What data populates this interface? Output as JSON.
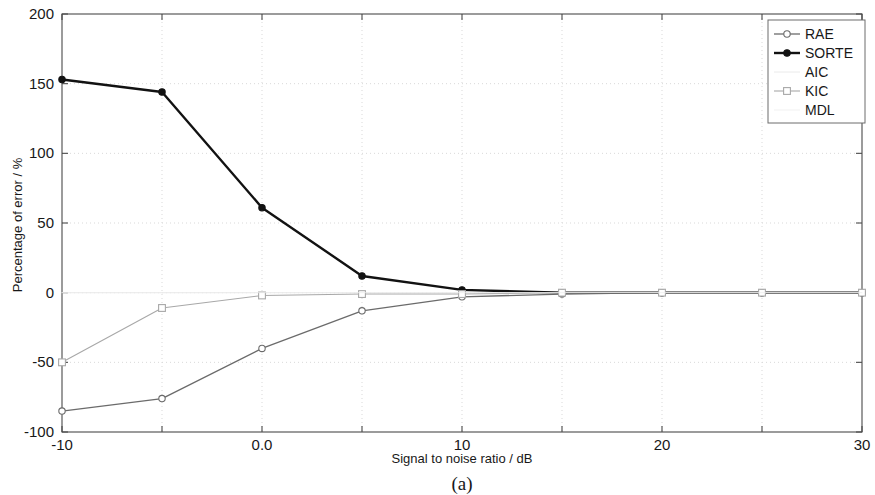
{
  "figure": {
    "caption": "(a)"
  },
  "chart_data": {
    "type": "line",
    "title": "",
    "xlabel": "Signal to noise ratio / dB",
    "ylabel": "Percentage of error / %",
    "xlim": [
      -10,
      30
    ],
    "ylim": [
      -100,
      200
    ],
    "xticks": [
      -10,
      -5,
      0,
      5,
      10,
      15,
      20,
      25,
      30
    ],
    "xticklabels": [
      "-10",
      "",
      "0.0",
      "",
      "10",
      "",
      "20",
      "",
      "30"
    ],
    "yticks": [
      -100,
      -50,
      0,
      50,
      100,
      150,
      200
    ],
    "yticklabels": [
      "-100",
      "-50",
      "0",
      "50",
      "100",
      "150",
      "200"
    ],
    "grid": true,
    "legend_position": "top-right",
    "x": [
      -10,
      -5,
      0,
      5,
      10,
      15,
      20,
      25,
      30
    ],
    "series": [
      {
        "name": "RAE",
        "color": "#6b6b6b",
        "marker": "circle",
        "marker_filled": false,
        "linewidth": 1.3,
        "values": [
          -85,
          -76,
          -40,
          -13,
          -3,
          -1,
          0,
          0,
          0
        ]
      },
      {
        "name": "SORTE",
        "color": "#121212",
        "marker": "circle",
        "marker_filled": true,
        "linewidth": 2.4,
        "values": [
          153,
          144,
          61,
          12,
          2,
          0,
          0,
          0,
          0
        ]
      },
      {
        "name": "AIC",
        "color": "#e4e4e4",
        "marker": "none",
        "marker_filled": false,
        "linewidth": 0.8,
        "values": [
          0,
          0,
          0,
          0,
          0,
          0,
          0,
          0,
          0
        ]
      },
      {
        "name": "KIC",
        "color": "#a8a8a8",
        "marker": "square",
        "marker_filled": false,
        "linewidth": 1.1,
        "values": [
          -50,
          -11,
          -2,
          -1,
          -1,
          0,
          0,
          0,
          0
        ]
      },
      {
        "name": "MDL",
        "color": "#ededed",
        "marker": "none",
        "marker_filled": false,
        "linewidth": 0.8,
        "values": [
          0,
          0,
          0,
          0,
          0,
          0,
          0,
          0,
          0
        ]
      }
    ]
  }
}
